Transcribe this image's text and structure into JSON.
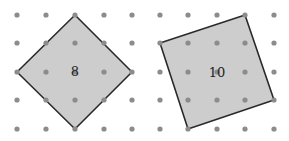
{
  "figures": [
    {
      "name": "left-square",
      "area_label": "8",
      "grid": {
        "cols": [
          17,
          46,
          75,
          104,
          132
        ],
        "rows": [
          15,
          43,
          72,
          100,
          129
        ]
      },
      "vertices": [
        [
          75,
          15
        ],
        [
          132,
          72
        ],
        [
          75,
          129
        ],
        [
          17,
          72
        ]
      ],
      "label_pos": [
        75,
        76
      ]
    },
    {
      "name": "right-square",
      "area_label": "10",
      "grid": {
        "cols": [
          160,
          188,
          217,
          245,
          274
        ],
        "rows": [
          15,
          43,
          72,
          100,
          129
        ]
      },
      "vertices": [
        [
          245,
          15
        ],
        [
          274,
          100
        ],
        [
          188,
          129
        ],
        [
          160,
          43
        ]
      ],
      "label_pos": [
        217,
        77
      ]
    }
  ],
  "colors": {
    "fill": "#cdcdcd",
    "stroke": "#2a2a2a",
    "dot": "#8c8c8c"
  }
}
